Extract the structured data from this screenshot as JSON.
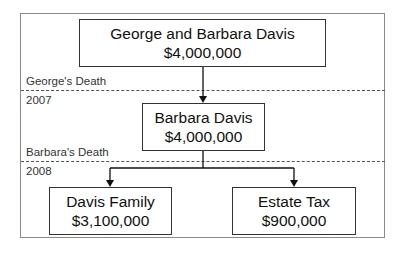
{
  "diagram": {
    "top_box": {
      "name": "George and Barbara Davis",
      "amount": "$4,000,000"
    },
    "middle_box": {
      "name": "Barbara Davis",
      "amount": "$4,000,000"
    },
    "left_box": {
      "name": "Davis Family",
      "amount": "$3,100,000"
    },
    "right_box": {
      "name": "Estate Tax",
      "amount": "$900,000"
    },
    "events": [
      {
        "above": "George's Death",
        "below": "2007"
      },
      {
        "above": "Barbara's Death",
        "below": "2008"
      }
    ]
  }
}
